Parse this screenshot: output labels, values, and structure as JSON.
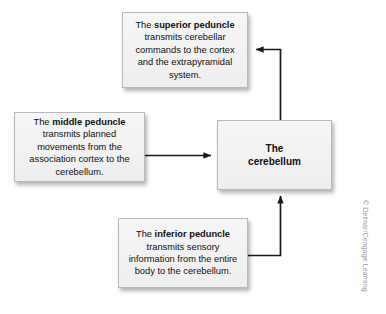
{
  "figure": {
    "credit": "© Delmar/Cengage Learning",
    "background_color": "#ffffff",
    "box_fill_color": "#f2f2f2",
    "box_border_color": "#b9b9b9",
    "arrow_color": "#1a1a1a"
  },
  "boxes": {
    "superior": {
      "lead": "The ",
      "emphasis": "superior peduncle",
      "body": " transmits cerebellar commands to the cortex and the extrapyramidal system."
    },
    "middle": {
      "lead": "The ",
      "emphasis": "middle peduncle",
      "body": " transmits planned movements from the association cortex to the cerebellum."
    },
    "inferior": {
      "lead": "The ",
      "emphasis": "inferior peduncle",
      "body": " transmits sensory information from the entire body to the cerebellum."
    },
    "cerebellum": {
      "line1": "The",
      "line2": "cerebellum"
    }
  },
  "arrows": [
    {
      "name": "cerebellum-to-superior",
      "from": "cerebellum",
      "to": "superior",
      "direction": "up-then-left"
    },
    {
      "name": "middle-to-cerebellum",
      "from": "middle",
      "to": "cerebellum",
      "direction": "right"
    },
    {
      "name": "inferior-to-cerebellum",
      "from": "inferior",
      "to": "cerebellum",
      "direction": "right-then-up"
    }
  ]
}
